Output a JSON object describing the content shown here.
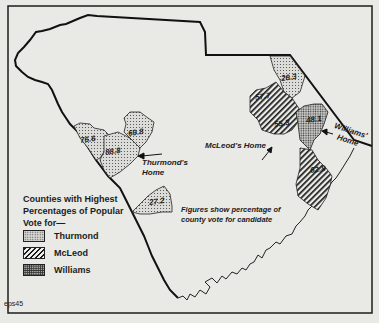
{
  "map": {
    "region": "South Carolina",
    "note_line1": "Figures show percentage of",
    "note_line2": "county vote for candidate",
    "credit": "eps45"
  },
  "legend": {
    "title_line1": "Counties with Highest",
    "title_line2": "Percentages of Popular",
    "title_line3": "Vote for—",
    "items": [
      {
        "label": "Thurmond",
        "pattern": "fine-dots"
      },
      {
        "label": "McLeod",
        "pattern": "diagonal-hatch"
      },
      {
        "label": "Williams",
        "pattern": "dense-dots"
      }
    ]
  },
  "counties": [
    {
      "value": "76.6",
      "candidate": "Thurmond"
    },
    {
      "value": "88.8",
      "candidate": "Thurmond"
    },
    {
      "value": "69.8",
      "candidate": "Thurmond"
    },
    {
      "value": "27.2",
      "candidate": "Thurmond"
    },
    {
      "value": "26.3",
      "candidate": "Thurmond"
    },
    {
      "value": "57.7",
      "candidate": "McLeod"
    },
    {
      "value": "55.3",
      "candidate": "McLeod"
    },
    {
      "value": "48.1",
      "candidate": "Williams"
    },
    {
      "value": "62.8",
      "candidate": "McLeod"
    }
  ],
  "homes": {
    "thurmond_line1": "Thurmond's",
    "thurmond_line2": "Home",
    "mcleod": "McLeod's Home",
    "williams_line1": "Williams'",
    "williams_line2": "Home"
  },
  "colors": {
    "background": "#e9e9e6",
    "ink": "#1c1c1c"
  }
}
